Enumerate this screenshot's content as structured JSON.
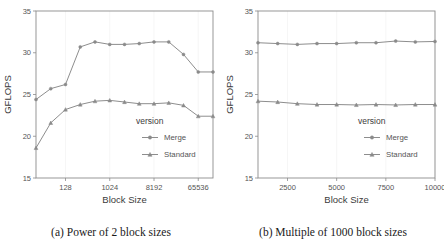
{
  "figure": {
    "captions": [
      "(a) Power of 2 block sizes",
      "(b) Multiple of 1000 block sizes"
    ]
  },
  "chart_data": [
    {
      "type": "line",
      "title": "",
      "xlabel": "Block Size",
      "ylabel": "GFLOPS",
      "xscale": "log2",
      "xlim": [
        32,
        131072
      ],
      "ylim": [
        15,
        35
      ],
      "grid": false,
      "legend_title": "version",
      "legend_position": "bottom-right",
      "xticks": [
        128,
        1024,
        8192,
        65536
      ],
      "xtick_labels": [
        "128",
        "1024",
        "8192",
        "65536"
      ],
      "yticks": [
        15,
        20,
        25,
        30,
        35
      ],
      "ytick_labels": [
        "15",
        "20",
        "25",
        "30",
        "35"
      ],
      "x": [
        32,
        64,
        128,
        256,
        512,
        1024,
        2048,
        4096,
        8192,
        16384,
        32768,
        65536,
        131072
      ],
      "series": [
        {
          "name": "Merge",
          "marker": "circle",
          "values": [
            24.4,
            25.7,
            26.2,
            30.7,
            31.3,
            31.0,
            31.0,
            31.1,
            31.3,
            31.3,
            29.8,
            27.7,
            27.7
          ]
        },
        {
          "name": "Standard",
          "marker": "triangle",
          "values": [
            18.6,
            21.6,
            23.2,
            23.8,
            24.2,
            24.3,
            24.1,
            23.9,
            23.9,
            24.0,
            23.7,
            22.4,
            22.4
          ]
        }
      ]
    },
    {
      "type": "line",
      "title": "",
      "xlabel": "Block Size",
      "ylabel": "GFLOPS",
      "xscale": "linear",
      "xlim": [
        1000,
        10000
      ],
      "ylim": [
        15,
        35
      ],
      "grid": false,
      "legend_title": "version",
      "legend_position": "bottom-right",
      "xticks": [
        2500,
        5000,
        7500,
        10000
      ],
      "xtick_labels": [
        "2500",
        "5000",
        "7500",
        "10000"
      ],
      "yticks": [
        15,
        20,
        25,
        30,
        35
      ],
      "ytick_labels": [
        "15",
        "20",
        "25",
        "30",
        "35"
      ],
      "x": [
        1000,
        2000,
        3000,
        4000,
        5000,
        6000,
        7000,
        8000,
        9000,
        10000
      ],
      "series": [
        {
          "name": "Merge",
          "marker": "circle",
          "values": [
            31.2,
            31.1,
            31.0,
            31.1,
            31.1,
            31.2,
            31.2,
            31.4,
            31.3,
            31.35
          ]
        },
        {
          "name": "Standard",
          "marker": "triangle",
          "values": [
            24.2,
            24.1,
            23.9,
            23.8,
            23.8,
            23.75,
            23.8,
            23.75,
            23.8,
            23.8
          ]
        }
      ]
    }
  ]
}
